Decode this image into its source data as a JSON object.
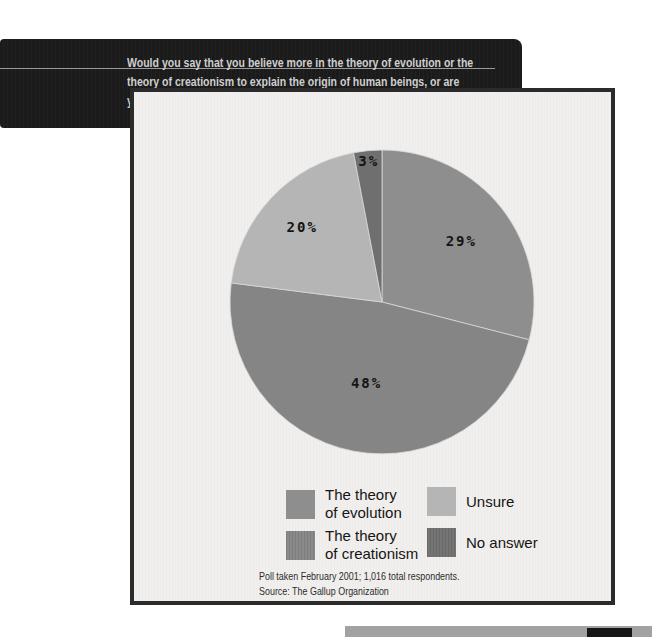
{
  "question": {
    "lines": [
      "Would you say that you believe more in the theory of evolution or the",
      "theory of creationism to explain the origin of human beings, or are",
      "you unsure?"
    ]
  },
  "chart_data": {
    "type": "pie",
    "title": "Would you say that you believe more in the theory of evolution or the theory of creationism to explain the origin of human beings, or are you unsure?",
    "categories": [
      "The theory of evolution",
      "The theory of creationism",
      "Unsure",
      "No answer"
    ],
    "values": [
      29,
      48,
      20,
      3
    ],
    "slice_labels": [
      "29%",
      "48%",
      "20%",
      "3%"
    ],
    "colors": [
      "#8e8e8e",
      "#858585",
      "#b5b5b5",
      "#6f6f6f"
    ],
    "start_angle_deg": 0,
    "direction": "clockwise",
    "label_radius_fraction": [
      0.66,
      0.54,
      0.72,
      0.93
    ],
    "legend_position": "bottom",
    "source": "Poll taken February 2001; 1,016 total respondents. Source: The Gallup Organization"
  },
  "legend": {
    "items": [
      {
        "label": "The theory\nof evolution",
        "color": "#8e8e8e"
      },
      {
        "label": "The theory\nof creationism",
        "color": "#858585"
      },
      {
        "label": "Unsure",
        "color": "#b5b5b5"
      },
      {
        "label": "No answer",
        "color": "#6f6f6f"
      }
    ]
  },
  "footer": {
    "line1": "Poll taken February 2001; 1,016 total respondents.",
    "line2": "Source: The Gallup Organization"
  }
}
